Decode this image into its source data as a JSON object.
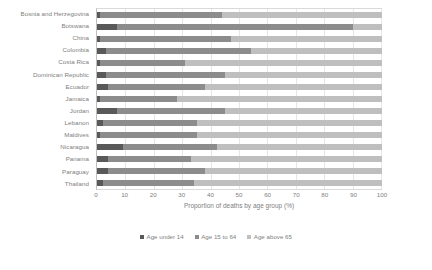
{
  "chart_data": {
    "type": "bar",
    "subtype": "stacked-horizontal-100",
    "title": "",
    "xlabel": "Proportion of deaths by age group (%)",
    "ylabel": "",
    "xlim": [
      0,
      100
    ],
    "xticks": [
      0,
      10,
      20,
      30,
      40,
      50,
      60,
      70,
      80,
      90,
      100
    ],
    "grid": true,
    "legend_position": "bottom",
    "categories": [
      "Bosnia and Herzegovina",
      "Botswana",
      "China",
      "Colombia",
      "Costa Rica",
      "Dominican Republic",
      "Ecuador",
      "Jamaica",
      "Jordan",
      "Lebanon",
      "Maldives",
      "Nicaragua",
      "Panama",
      "Paraguay",
      "Thailand"
    ],
    "series": [
      {
        "name": "Age under 14",
        "color": "#595959",
        "values": [
          1,
          7,
          1,
          3,
          1,
          3,
          4,
          1,
          7,
          2,
          1,
          9,
          4,
          4,
          2
        ]
      },
      {
        "name": "Age 15 to 64",
        "color": "#8c8c8c",
        "values": [
          43,
          83,
          46,
          51,
          30,
          42,
          34,
          27,
          38,
          33,
          34,
          33,
          29,
          34,
          32
        ]
      },
      {
        "name": "Age above 65",
        "color": "#bfbfbf",
        "values": [
          56,
          10,
          53,
          46,
          69,
          55,
          62,
          72,
          55,
          65,
          65,
          58,
          67,
          62,
          66
        ]
      }
    ],
    "legend": [
      {
        "label": "Age under 14",
        "color": "#595959"
      },
      {
        "label": "Age 15 to 64",
        "color": "#8c8c8c"
      },
      {
        "label": "Age above 65",
        "color": "#bfbfbf"
      }
    ]
  }
}
